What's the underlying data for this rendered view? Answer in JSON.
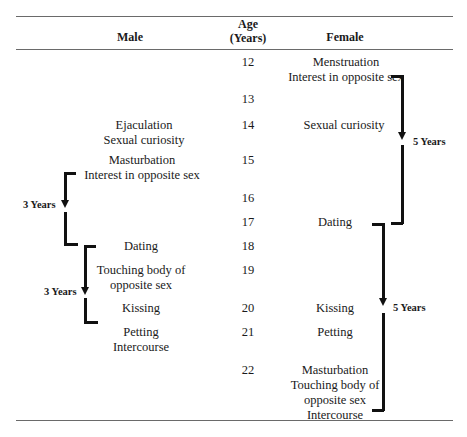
{
  "header": {
    "male": "Male",
    "age_line1": "Age",
    "age_line2": "(Years)",
    "female": "Female"
  },
  "ages": [
    "12",
    "13",
    "14",
    "15",
    "16",
    "17",
    "18",
    "19",
    "20",
    "21",
    "22"
  ],
  "male_events": {
    "e14": [
      "Ejaculation",
      "Sexual curiosity"
    ],
    "e15": [
      "Masturbation",
      "Interest in opposite sex"
    ],
    "e18": [
      "Dating"
    ],
    "e19": [
      "Touching body of",
      "opposite sex"
    ],
    "e20": [
      "Kissing"
    ],
    "e21": [
      "Petting",
      "Intercourse"
    ]
  },
  "female_events": {
    "e12": [
      "Menstruation",
      "Interest in opposite sex"
    ],
    "e14": [
      "Sexual curiosity"
    ],
    "e17": [
      "Dating"
    ],
    "e20": [
      "Kissing"
    ],
    "e21": [
      "Petting"
    ],
    "e22": [
      "Masturbation",
      "Touching body of",
      "opposite sex",
      "Intercourse"
    ]
  },
  "brackets": {
    "male_1": "3 Years",
    "male_2": "3 Years",
    "female_1": "5 Years",
    "female_2": "5 Years"
  }
}
